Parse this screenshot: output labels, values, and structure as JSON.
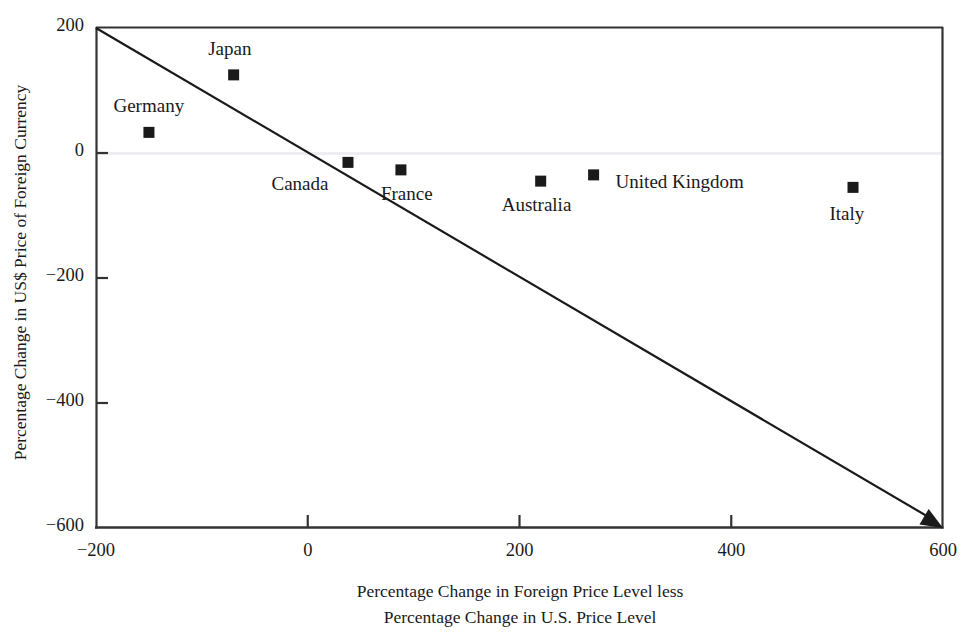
{
  "chart_data": {
    "type": "scatter",
    "title": "",
    "xlabel": "Percentage Change in Foreign Price Level less Percentage Change in U.S. Price Level",
    "xlabel_line1": "Percentage Change in Foreign Price Level less",
    "xlabel_line2": "Percentage Change in U.S. Price Level",
    "ylabel": "Percentage Change in US$ Price of Foreign Currency",
    "xlim": [
      -200,
      600
    ],
    "ylim": [
      -600,
      200
    ],
    "xticks": [
      "-200",
      "0",
      "200",
      "400",
      "600"
    ],
    "xtick_values": [
      -200,
      0,
      200,
      400,
      600
    ],
    "yticks": [
      "200",
      "0",
      "-200",
      "-400",
      "-600"
    ],
    "ytick_values": [
      200,
      0,
      -200,
      -400,
      -600
    ],
    "grid": false,
    "legend": "none",
    "marker": "filled-square",
    "marker_color": "#1a1a1a",
    "points": [
      {
        "label": "Japan",
        "x": -70,
        "y": 125,
        "label_dx": -4,
        "label_dy": -26
      },
      {
        "label": "Germany",
        "x": -150,
        "y": 33,
        "label_dx": 0,
        "label_dy": -26
      },
      {
        "label": "Canada",
        "x": 38,
        "y": -15,
        "label_dx": -48,
        "label_dy": 22
      },
      {
        "label": "France",
        "x": 88,
        "y": -27,
        "label_dx": 6,
        "label_dy": 24
      },
      {
        "label": "Australia",
        "x": 220,
        "y": -45,
        "label_dx": -4,
        "label_dy": 24
      },
      {
        "label": "United Kingdom",
        "x": 270,
        "y": -35,
        "label_dx": 22,
        "label_dy": 7
      },
      {
        "label": "Italy",
        "x": 515,
        "y": -55,
        "label_dx": -6,
        "label_dy": 27
      }
    ],
    "reference_line": {
      "name": "purchasing-power-parity-line",
      "from": [
        -200,
        200
      ],
      "to": [
        600,
        -600
      ],
      "slope": -1,
      "arrow_at_end": true,
      "color": "#1a1a1a"
    },
    "zero_gridline": {
      "y": 0,
      "color": "#ededf2"
    },
    "axis_color": "#333333",
    "plot_box": {
      "left": 96,
      "top": 28,
      "right": 943,
      "bottom": 528
    }
  }
}
